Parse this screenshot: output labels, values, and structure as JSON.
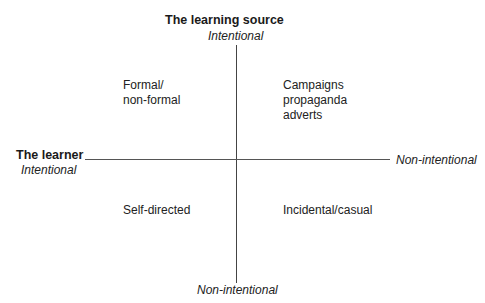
{
  "diagram": {
    "vertical_axis": {
      "title": "The learning source",
      "top_label": "Intentional",
      "bottom_label": "Non-intentional"
    },
    "horizontal_axis": {
      "title": "The learner",
      "left_label": "Intentional",
      "right_label": "Non-intentional"
    },
    "quadrants": {
      "top_left": [
        "Formal/",
        "non-formal"
      ],
      "top_right": [
        "Campaigns",
        "propaganda",
        "adverts"
      ],
      "bottom_left": [
        "Self-directed"
      ],
      "bottom_right": [
        "Incidental/casual"
      ]
    }
  }
}
